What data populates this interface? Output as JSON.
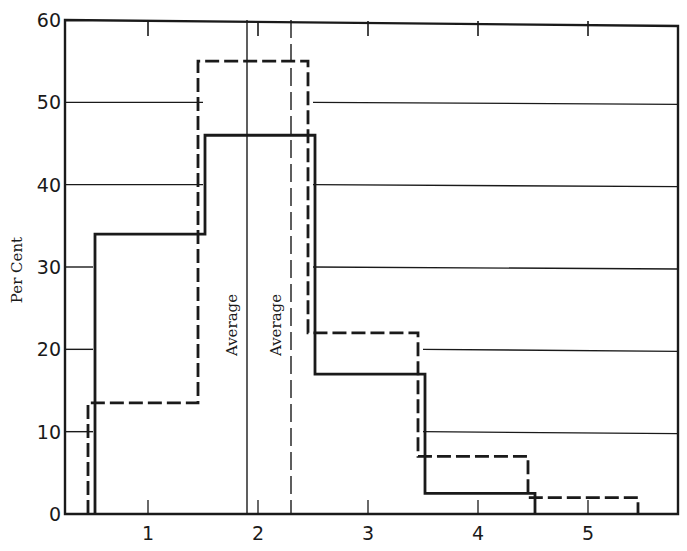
{
  "chart_data": {
    "type": "bar",
    "subtype": "step-histogram",
    "title": "",
    "xlabel": "",
    "ylabel": "Per Cent",
    "xlim": [
      0,
      6
    ],
    "ylim": [
      0,
      60
    ],
    "x_ticks": [
      1,
      2,
      3,
      4,
      5
    ],
    "x_tick_labels": [
      "1",
      "2",
      "3",
      "4",
      "5"
    ],
    "y_ticks": [
      0,
      10,
      20,
      30,
      40,
      50,
      60
    ],
    "y_tick_labels": [
      "0",
      "10",
      "20",
      "30",
      "40",
      "50",
      "60"
    ],
    "grid": "horizontal (drawn outside histogram envelope)",
    "legend": null,
    "categories": [
      "1",
      "2",
      "3",
      "4",
      "5"
    ],
    "series": [
      {
        "name": "solid",
        "style": "solid",
        "values": [
          34,
          46,
          17,
          2.5,
          0
        ]
      },
      {
        "name": "dashed",
        "style": "dashed",
        "values": [
          13.5,
          55,
          22,
          7,
          2
        ]
      }
    ],
    "annotations": [
      {
        "text": "Average",
        "x": 1.9,
        "style": "solid",
        "orientation": "vertical"
      },
      {
        "text": "Average",
        "x": 2.3,
        "style": "dashed",
        "orientation": "vertical"
      }
    ]
  },
  "labels": {
    "ylabel": "Per Cent",
    "avg_solid": "Average",
    "avg_dashed": "Average"
  }
}
